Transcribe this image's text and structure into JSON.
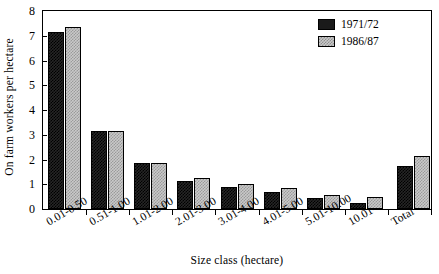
{
  "chart_data": {
    "type": "bar",
    "title": "",
    "xlabel": "Size class (hectare)",
    "ylabel": "On farm workers per hectare",
    "categories": [
      "0.01-0.50",
      "0.51-1.00",
      "1.01-2.00",
      "2.01-3.00",
      "3.01-4.00",
      "4.01-5.00",
      "5.01-10.00",
      "10.01-",
      "Total"
    ],
    "series": [
      {
        "name": "1971/72",
        "color": "#1a1a1a",
        "values": [
          7.15,
          3.15,
          1.85,
          1.15,
          0.9,
          0.7,
          0.45,
          0.25,
          1.75
        ]
      },
      {
        "name": "1986/87",
        "color": "#c9c9c9",
        "values": [
          7.35,
          3.15,
          1.85,
          1.25,
          1.0,
          0.85,
          0.55,
          0.5,
          2.15
        ]
      }
    ],
    "ylim": [
      0,
      8
    ],
    "yticks": [
      0,
      1,
      2,
      3,
      4,
      5,
      6,
      7,
      8
    ],
    "ytick_labels": [
      "0",
      "1",
      "2",
      "3",
      "4",
      "5",
      "6",
      "7",
      "8"
    ],
    "grid": false,
    "legend_position": "top-right"
  }
}
